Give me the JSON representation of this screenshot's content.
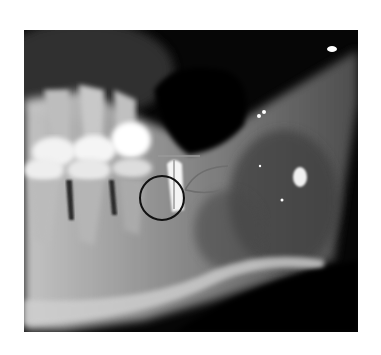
{
  "image": {
    "kind": "dental radiograph (mandible, lateral view)",
    "background": "#ffffff",
    "frame": {
      "x": 24,
      "y": 30,
      "width": 334,
      "height": 302
    }
  },
  "annotations": {
    "circle": {
      "cx": 138,
      "cy": 168,
      "r": 22,
      "stroke": "#111111"
    },
    "horizontal_line": {
      "x1": 134,
      "y1": 126,
      "x2": 176,
      "y2": 126,
      "stroke": "#9a9a9a"
    },
    "vertical_line": {
      "x1": 150,
      "y1": 130,
      "x2": 150,
      "y2": 179,
      "stroke": "#9a9a9a"
    },
    "loop_outline": {
      "stroke": "#6e6e6e"
    }
  }
}
